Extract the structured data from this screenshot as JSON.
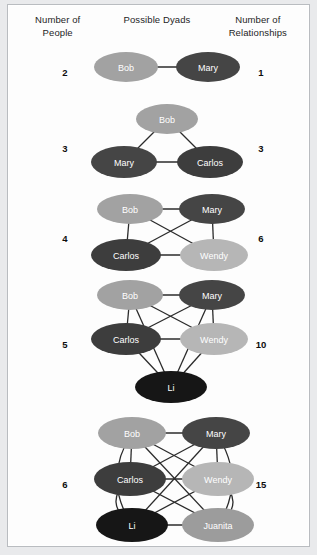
{
  "headers": {
    "left": [
      "Number of",
      "People"
    ],
    "middle": [
      "Possible Dyads"
    ],
    "right": [
      "Number of",
      "Relationships"
    ]
  },
  "palette": {
    "bob": "#a2a2a2",
    "mary": "#454545",
    "carlos": "#3d3d3d",
    "wendy": "#b6b6b6",
    "li": "#161616",
    "juanita": "#9c9c9c",
    "edge": "#2b2b2b",
    "label": "#ffffff",
    "background": "#fdfdfd",
    "frame": "#b9bcc0"
  },
  "chart_data": {
    "type": "diagram",
    "title": "Possible Dyads",
    "xlabel": "Number of People",
    "ylabel": "Number of Relationships",
    "formula": "n(n-1)/2",
    "categories": [
      2,
      3,
      4,
      5,
      6
    ],
    "values": [
      1,
      3,
      6,
      10,
      15
    ],
    "rows": [
      {
        "people": "2",
        "relationships": "1",
        "nodes": [
          {
            "name": "Bob",
            "color": "#a2a2a2",
            "cx": 40,
            "cy": 22,
            "rx": 32,
            "ry": 15
          },
          {
            "name": "Mary",
            "color": "#454545",
            "cx": 122,
            "cy": 22,
            "rx": 32,
            "ry": 15
          }
        ],
        "edges": [
          [
            0,
            1
          ]
        ]
      },
      {
        "people": "3",
        "relationships": "3",
        "nodes": [
          {
            "name": "Bob",
            "color": "#a2a2a2",
            "cx": 81,
            "cy": 18,
            "rx": 31,
            "ry": 15
          },
          {
            "name": "Mary",
            "color": "#454545",
            "cx": 38,
            "cy": 61,
            "rx": 33,
            "ry": 16
          },
          {
            "name": "Carlos",
            "color": "#3d3d3d",
            "cx": 124,
            "cy": 61,
            "rx": 33,
            "ry": 16
          }
        ],
        "edges": [
          [
            0,
            1
          ],
          [
            0,
            2
          ],
          [
            1,
            2
          ]
        ]
      },
      {
        "people": "4",
        "relationships": "6",
        "nodes": [
          {
            "name": "Bob",
            "color": "#a2a2a2",
            "cx": 44,
            "cy": 20,
            "rx": 33,
            "ry": 15
          },
          {
            "name": "Mary",
            "color": "#454545",
            "cx": 126,
            "cy": 20,
            "rx": 33,
            "ry": 15
          },
          {
            "name": "Carlos",
            "color": "#3d3d3d",
            "cx": 40,
            "cy": 66,
            "rx": 35,
            "ry": 16
          },
          {
            "name": "Wendy",
            "color": "#b6b6b6",
            "cx": 128,
            "cy": 66,
            "rx": 34,
            "ry": 16
          }
        ],
        "edges": [
          [
            0,
            1
          ],
          [
            0,
            2
          ],
          [
            0,
            3
          ],
          [
            1,
            2
          ],
          [
            1,
            3
          ],
          [
            2,
            3
          ]
        ]
      },
      {
        "people": "5",
        "relationships": "10",
        "nodes": [
          {
            "name": "Bob",
            "color": "#a2a2a2",
            "cx": 44,
            "cy": 18,
            "rx": 33,
            "ry": 15
          },
          {
            "name": "Mary",
            "color": "#454545",
            "cx": 126,
            "cy": 18,
            "rx": 33,
            "ry": 15
          },
          {
            "name": "Carlos",
            "color": "#3d3d3d",
            "cx": 40,
            "cy": 62,
            "rx": 35,
            "ry": 16
          },
          {
            "name": "Wendy",
            "color": "#b6b6b6",
            "cx": 128,
            "cy": 62,
            "rx": 34,
            "ry": 16
          },
          {
            "name": "Li",
            "color": "#161616",
            "cx": 85,
            "cy": 110,
            "rx": 36,
            "ry": 16
          }
        ],
        "edges": [
          [
            0,
            1
          ],
          [
            0,
            2
          ],
          [
            0,
            3
          ],
          [
            1,
            2
          ],
          [
            1,
            3
          ],
          [
            2,
            3
          ],
          [
            0,
            4
          ],
          [
            1,
            4
          ],
          [
            2,
            4
          ],
          [
            3,
            4
          ]
        ]
      },
      {
        "people": "6",
        "relationships": "15",
        "nodes": [
          {
            "name": "Bob",
            "color": "#a2a2a2",
            "cx": 46,
            "cy": 18,
            "rx": 34,
            "ry": 16
          },
          {
            "name": "Mary",
            "color": "#454545",
            "cx": 130,
            "cy": 18,
            "rx": 34,
            "ry": 16
          },
          {
            "name": "Carlos",
            "color": "#3d3d3d",
            "cx": 44,
            "cy": 64,
            "rx": 36,
            "ry": 17
          },
          {
            "name": "Wendy",
            "color": "#b6b6b6",
            "cx": 132,
            "cy": 64,
            "rx": 36,
            "ry": 17
          },
          {
            "name": "Li",
            "color": "#161616",
            "cx": 46,
            "cy": 110,
            "rx": 36,
            "ry": 17
          },
          {
            "name": "Juanita",
            "color": "#9c9c9c",
            "cx": 132,
            "cy": 110,
            "rx": 36,
            "ry": 17
          }
        ],
        "edges": [
          [
            0,
            1
          ],
          [
            0,
            2
          ],
          [
            0,
            3
          ],
          [
            1,
            2
          ],
          [
            1,
            3
          ],
          [
            2,
            3
          ],
          [
            0,
            5
          ],
          [
            1,
            4
          ],
          [
            2,
            5
          ],
          [
            3,
            4
          ],
          [
            4,
            5
          ]
        ],
        "arcs": [
          {
            "from": 0,
            "to": 4,
            "side": "left"
          },
          {
            "from": 2,
            "to": 4,
            "side": "left"
          },
          {
            "from": 1,
            "to": 5,
            "side": "right"
          },
          {
            "from": 3,
            "to": 5,
            "side": "right"
          }
        ]
      }
    ]
  },
  "layout": {
    "rowTops": [
      40,
      96,
      184,
      272,
      410
    ],
    "rowHeights": [
      52,
      86,
      88,
      132,
      140
    ],
    "graphLeft": 78,
    "graphWidth": 170,
    "numOffsets": [
      22,
      42,
      44,
      62,
      64
    ]
  }
}
